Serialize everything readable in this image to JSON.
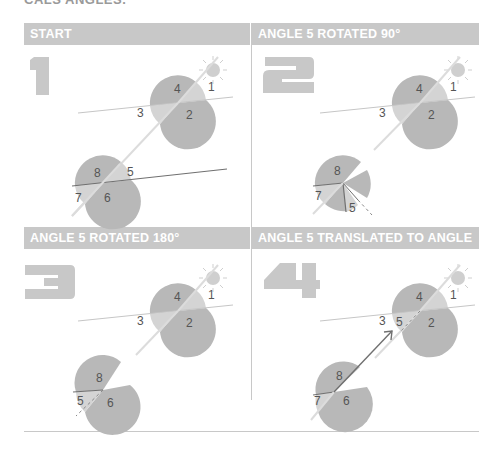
{
  "top_text": "CALS ANGLES.",
  "panels": [
    {
      "number": "1",
      "title": "START"
    },
    {
      "number": "2",
      "title": "ANGLE 5 ROTATED 90°"
    },
    {
      "number": "3",
      "title": "ANGLE 5 ROTATED 180°"
    },
    {
      "number": "4",
      "title": "ANGLE 5 TRANSLATED TO ANGLE 3"
    }
  ],
  "angle_labels": [
    "1",
    "2",
    "3",
    "4",
    "5",
    "6",
    "7",
    "8"
  ],
  "colors": {
    "header": "#c8c8c8",
    "disc": "#b8b8b8",
    "disc_light": "#d4d4d4",
    "line": "#c6c6c6",
    "dark_line": "#707070",
    "number": "#c4c4c4"
  }
}
